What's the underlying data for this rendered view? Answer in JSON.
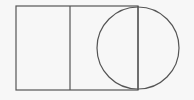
{
  "diagram": {
    "shapes": [
      {
        "name": "rectangle",
        "type": "rect"
      },
      {
        "name": "divider-line",
        "type": "line"
      },
      {
        "name": "circle",
        "type": "circle"
      },
      {
        "name": "diameter-line",
        "type": "line"
      }
    ],
    "stroke_color": "#555555",
    "background_color": "#f7f7f7"
  }
}
